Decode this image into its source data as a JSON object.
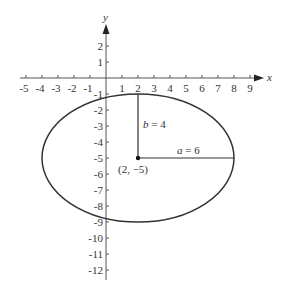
{
  "figure": {
    "x_axis_label": "x",
    "y_axis_label": "y",
    "x_ticks": [
      "-5",
      "-4",
      "-3",
      "-2",
      "-1",
      "1",
      "2",
      "3",
      "4",
      "5",
      "6",
      "7",
      "8",
      "9"
    ],
    "y_ticks": [
      "2",
      "1",
      "-1",
      "-2",
      "-3",
      "-4",
      "-5",
      "-6",
      "-7",
      "-8",
      "-9",
      "-10",
      "-11",
      "-12"
    ],
    "b_label": "b = 4",
    "a_label": "a = 6",
    "center_label": "(2, −5)"
  },
  "chart_data": {
    "type": "diagram",
    "shape": "ellipse",
    "center": [
      2,
      -5
    ],
    "a": 6,
    "b": 4,
    "xlabel": "x",
    "ylabel": "y",
    "xlim": [
      -5,
      9
    ],
    "ylim": [
      -12,
      2
    ],
    "annotations": [
      "b = 4",
      "a = 6",
      "(2, −5)"
    ],
    "grid": false
  }
}
